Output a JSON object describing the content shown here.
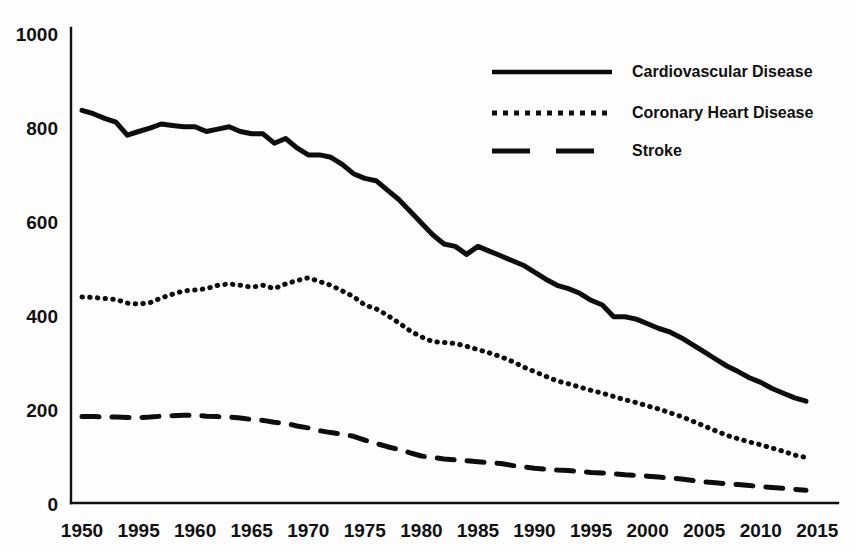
{
  "chart_data": {
    "type": "line",
    "title": "",
    "xlabel": "",
    "ylabel": "",
    "xlim": [
      1950,
      2015
    ],
    "ylim": [
      0,
      1000
    ],
    "grid": false,
    "legend_position": "top-right",
    "x_tick_labels": [
      "1950",
      "1995",
      "1960",
      "1965",
      "1970",
      "1975",
      "1980",
      "1985",
      "1990",
      "1995",
      "2000",
      "2005",
      "2010",
      "2015"
    ],
    "x_tick_values": [
      1950,
      1955,
      1960,
      1965,
      1970,
      1975,
      1980,
      1985,
      1990,
      1995,
      2000,
      2005,
      2010,
      2015
    ],
    "y_tick_labels": [
      "0",
      "200",
      "400",
      "600",
      "800",
      "1000"
    ],
    "y_tick_values": [
      0,
      200,
      400,
      600,
      800,
      1000
    ],
    "x": [
      1950,
      1951,
      1952,
      1953,
      1954,
      1955,
      1956,
      1957,
      1958,
      1959,
      1960,
      1961,
      1962,
      1963,
      1964,
      1965,
      1966,
      1967,
      1968,
      1969,
      1970,
      1971,
      1972,
      1973,
      1974,
      1975,
      1976,
      1977,
      1978,
      1979,
      1980,
      1981,
      1982,
      1983,
      1984,
      1985,
      1986,
      1987,
      1988,
      1989,
      1990,
      1991,
      1992,
      1993,
      1994,
      1995,
      1996,
      1997,
      1998,
      1999,
      2000,
      2001,
      2002,
      2003,
      2004,
      2005,
      2006,
      2007,
      2008,
      2009,
      2010,
      2011,
      2012,
      2013,
      2014
    ],
    "series": [
      {
        "name": "Cardiovascular Disease",
        "style": "solid",
        "color": "#0d0d0d",
        "values": [
          835,
          828,
          818,
          810,
          782,
          790,
          797,
          806,
          803,
          800,
          800,
          790,
          795,
          800,
          790,
          785,
          785,
          765,
          775,
          755,
          740,
          740,
          735,
          720,
          700,
          690,
          685,
          665,
          645,
          620,
          595,
          570,
          550,
          545,
          528,
          545,
          535,
          525,
          515,
          505,
          490,
          475,
          462,
          455,
          445,
          430,
          420,
          395,
          395,
          390,
          380,
          370,
          362,
          350,
          335,
          320,
          305,
          290,
          278,
          265,
          255,
          242,
          232,
          222,
          215
        ]
      },
      {
        "name": "Coronary Heart Disease",
        "style": "dotted",
        "color": "#0d0d0d",
        "values": [
          437,
          436,
          434,
          432,
          424,
          422,
          425,
          435,
          443,
          450,
          452,
          455,
          462,
          465,
          462,
          458,
          462,
          455,
          465,
          472,
          478,
          470,
          462,
          450,
          438,
          420,
          412,
          398,
          382,
          365,
          352,
          342,
          340,
          338,
          332,
          325,
          318,
          310,
          300,
          288,
          278,
          268,
          258,
          252,
          245,
          238,
          232,
          225,
          218,
          212,
          205,
          198,
          190,
          182,
          172,
          162,
          152,
          142,
          135,
          128,
          122,
          115,
          108,
          100,
          95
        ]
      },
      {
        "name": "Stroke",
        "style": "dashed",
        "color": "#0d0d0d",
        "values": [
          182,
          182,
          181,
          181,
          180,
          180,
          181,
          183,
          184,
          185,
          185,
          183,
          182,
          181,
          179,
          176,
          174,
          170,
          168,
          162,
          158,
          152,
          148,
          145,
          140,
          132,
          125,
          118,
          112,
          105,
          98,
          95,
          92,
          90,
          88,
          86,
          84,
          82,
          78,
          75,
          72,
          70,
          68,
          67,
          65,
          63,
          62,
          60,
          58,
          57,
          55,
          53,
          51,
          49,
          46,
          43,
          41,
          39,
          37,
          35,
          33,
          31,
          29,
          27,
          25
        ]
      }
    ]
  },
  "legend": {
    "items": [
      {
        "label": "Cardiovascular Disease",
        "style": "solid"
      },
      {
        "label": "Coronary Heart Disease",
        "style": "dotted"
      },
      {
        "label": "Stroke",
        "style": "dashed"
      }
    ]
  }
}
